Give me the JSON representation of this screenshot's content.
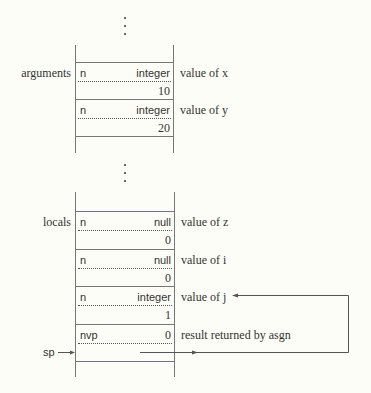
{
  "upper_stack": {
    "label": "arguments",
    "descriptors": [
      {
        "left": "n",
        "right": "integer",
        "value": "10",
        "note": "value of x"
      },
      {
        "left": "n",
        "right": "integer",
        "value": "20",
        "note": "value of y"
      }
    ]
  },
  "lower_stack": {
    "label": "locals",
    "descriptors": [
      {
        "left": "n",
        "right": "null",
        "value": "0",
        "note": "value of z"
      },
      {
        "left": "n",
        "right": "null",
        "value": "0",
        "note": "value of i"
      },
      {
        "left": "n",
        "right": "integer",
        "value": "1",
        "note": "value of j"
      },
      {
        "left": "nvp",
        "right": "0",
        "value": "",
        "note": "result returned by asgn"
      }
    ],
    "pointer_label": "sp"
  },
  "ellipsis": "⋮"
}
